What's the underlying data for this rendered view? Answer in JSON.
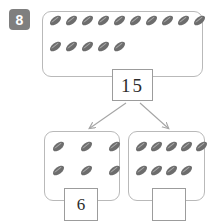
{
  "worksheet": {
    "problem_number": "8",
    "whole_box": {
      "name": "whole-group",
      "row_counts": [
        10,
        5
      ],
      "total_objects": 15,
      "object_type": "bean-counter"
    },
    "total_value_box": {
      "value": "15",
      "filled": true
    },
    "part_left": {
      "name": "left-part-group",
      "row_counts": [
        3,
        3
      ],
      "total_objects": 6,
      "answer_box": {
        "value": "6",
        "filled": true
      }
    },
    "part_right": {
      "name": "right-part-group",
      "row_counts": [
        5,
        4
      ],
      "total_objects": 9,
      "answer_box": {
        "value": "",
        "filled": false
      }
    },
    "colors": {
      "bean_dark": "#6d6d6d",
      "bean_highlight": "#a8a8a8",
      "box_border": "#b9b9b9",
      "num_box_border": "#9c9c9c",
      "badge_background": "#7f7f7f",
      "badge_text": "#ffffff",
      "arrow": "#a5a5a5"
    }
  }
}
